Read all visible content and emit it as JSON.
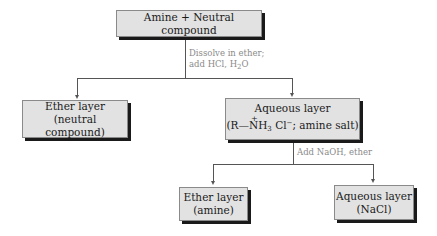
{
  "diagram": {
    "type": "flowchart",
    "title_box": {
      "label": "Amine + Neutral compound"
    },
    "step1": {
      "line1": "Dissolve in ether;",
      "line2_prefix": "add HCl, H",
      "line2_sub": "2",
      "line2_suffix": "O"
    },
    "left_box": {
      "line1": "Ether layer",
      "line2": "(neutral compound)"
    },
    "right_box": {
      "line1": "Aqueous layer",
      "formula_prefix": "(R—",
      "formula_plus": "+",
      "formula_n": "N",
      "formula_h": "H",
      "formula_sub": "3",
      "formula_cl": " Cl",
      "formula_sup": "−",
      "formula_suffix": "; amine salt)"
    },
    "step2": {
      "label": "Add NaOH, ether"
    },
    "bottom_left_box": {
      "line1": "Ether layer",
      "line2": "(amine)"
    },
    "bottom_right_box": {
      "line1": "Aqueous layer",
      "line2": "(NaCl)"
    },
    "colors": {
      "box_fill": "#e2e2e2",
      "box_shadow": "#1a1a1a",
      "line": "#555555",
      "annotation_text": "#8a8a8a"
    }
  }
}
